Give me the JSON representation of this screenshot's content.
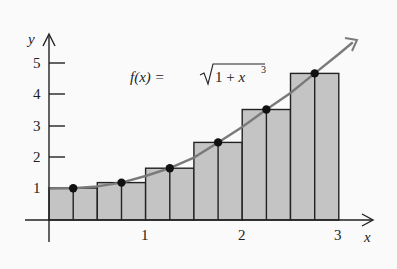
{
  "figure": {
    "function_label": "f(x) = ",
    "function_radicand": "1 + x",
    "function_exponent": "3",
    "x_axis_label": "x",
    "y_axis_label": "y",
    "x_ticks": [
      "1",
      "2",
      "3"
    ],
    "y_ticks": [
      "1",
      "2",
      "3",
      "4",
      "5"
    ],
    "colors": {
      "bar_fill": "#c4c4c4",
      "curve": "#7a7a7a",
      "axis": "#222222",
      "point": "#111111"
    }
  },
  "chart_data": {
    "type": "bar",
    "xlabel": "x",
    "ylabel": "y",
    "xlim": [
      0,
      3
    ],
    "ylim": [
      0,
      5
    ],
    "bar_width": 0.25,
    "note": "Shaded rectangles drawn in pairs sharing midpoint heights (6 sample points, each spanning two bars)",
    "midpoints": [
      0.25,
      0.75,
      1.25,
      1.75,
      2.25,
      2.75
    ],
    "values": [
      1.01,
      1.19,
      1.65,
      2.47,
      3.52,
      4.67
    ],
    "curve": "sqrt(1 + x^3)"
  }
}
